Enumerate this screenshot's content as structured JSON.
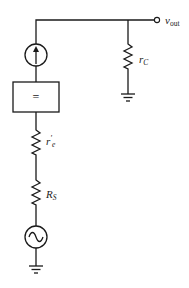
{
  "diagram": {
    "type": "small-signal equivalent circuit",
    "colors": {
      "stroke": "#1a1a1a",
      "background": "#ffffff",
      "text": "#222222"
    },
    "labels": {
      "vout_main": "v",
      "vout_sub": "out",
      "rc_main": "r",
      "rc_sub": "C",
      "re_main": "r",
      "re_prime": "'",
      "re_sub": "e",
      "rs_main": "R",
      "rs_sub": "S",
      "box_symbol": "="
    },
    "components": [
      {
        "id": "current-source",
        "kind": "dependent current source (arrow up)"
      },
      {
        "id": "box",
        "kind": "block",
        "symbol": "="
      },
      {
        "id": "r-e-prime",
        "kind": "resistor",
        "label": "r'e"
      },
      {
        "id": "r-s",
        "kind": "resistor",
        "label": "RS"
      },
      {
        "id": "ac-source",
        "kind": "ac voltage source"
      },
      {
        "id": "ground-left",
        "kind": "ground"
      },
      {
        "id": "r-c",
        "kind": "resistor",
        "label": "rC"
      },
      {
        "id": "ground-right",
        "kind": "ground"
      },
      {
        "id": "output-terminal",
        "kind": "terminal",
        "label": "vout"
      }
    ]
  }
}
